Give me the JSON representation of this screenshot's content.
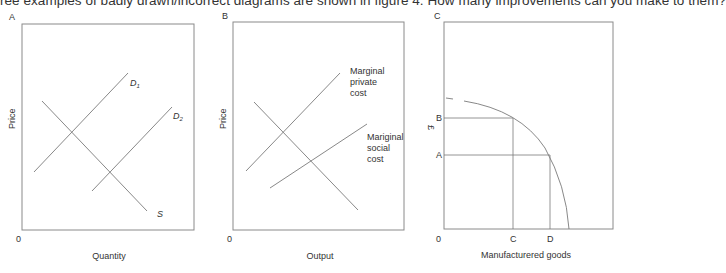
{
  "intro_text": "ree examples of badly drawn/incorrect diagrams are shown in figure 4. How many improvements can you make to them?",
  "colors": {
    "line": "#7a7a7a",
    "box": "#8a8a8a",
    "text": "#333333"
  },
  "panels": [
    {
      "id": "A",
      "label": "A",
      "y_axis_label": "Price",
      "x_axis_label": "Quantity",
      "origin_label": "0",
      "curves": [
        {
          "name": "D1",
          "label_main": "D",
          "label_sub": "1"
        },
        {
          "name": "D2",
          "label_main": "D",
          "label_sub": "2"
        },
        {
          "name": "S",
          "label_main": "S",
          "label_sub": ""
        }
      ]
    },
    {
      "id": "B",
      "label": "B",
      "y_axis_label": "Price",
      "x_axis_label": "Output",
      "origin_label": "0",
      "curves": [
        {
          "name": "MPC",
          "label_lines": [
            "Marginal",
            "private",
            "cost"
          ]
        },
        {
          "name": "MSC",
          "label_lines": [
            "Mariginal",
            "social",
            "cost"
          ]
        },
        {
          "name": "demand",
          "label_lines": []
        }
      ]
    },
    {
      "id": "C",
      "label": "C",
      "y_axis_label": "£",
      "x_axis_label": "Manufacturered goods",
      "origin_label": "0",
      "y_points": [
        "B",
        "A"
      ],
      "x_points": [
        "C",
        "D"
      ]
    }
  ]
}
